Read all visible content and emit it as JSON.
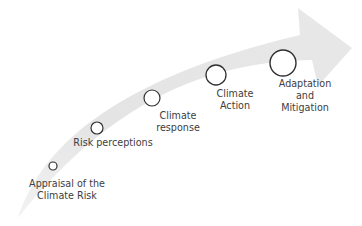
{
  "diagram": {
    "type": "process-arrow",
    "arrow_color": "#e6e6e6",
    "circle_stroke": "#303030",
    "circle_fill": "#ffffff",
    "text_color": "#404040",
    "stages": [
      {
        "line1": "Appraisal of the",
        "line2": "Climate Risk"
      },
      {
        "line1": "Risk perceptions",
        "line2": ""
      },
      {
        "line1": "Climate",
        "line2": "response"
      },
      {
        "line1": "Climate",
        "line2": "Action"
      },
      {
        "line1": "Adaptation",
        "line2": "and",
        "line3": "Mitigation"
      }
    ]
  }
}
